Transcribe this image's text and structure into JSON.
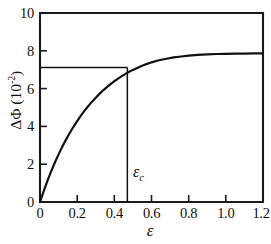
{
  "chart_data": {
    "type": "line",
    "title": "",
    "subtitle": "",
    "xlabel": "ε",
    "ylabel": "ΔΦ (10⁻²)",
    "ylabel_main": "ΔΦ (10",
    "ylabel_exponent": "-2",
    "ylabel_close": ")",
    "xlim": [
      0,
      1.2
    ],
    "ylim": [
      0,
      10
    ],
    "grid": false,
    "legend": "none",
    "x_ticks": [
      0,
      0.2,
      0.4,
      0.6,
      0.8,
      1.0,
      1.2
    ],
    "x_tick_labels": [
      "0",
      "0.2",
      "0.4",
      "0.6",
      "0.8",
      "1.0",
      "1.2"
    ],
    "y_ticks": [
      0,
      2,
      4,
      6,
      8,
      10
    ],
    "y_tick_labels": [
      "0",
      "2",
      "4",
      "6",
      "8",
      "10"
    ],
    "series": [
      {
        "name": "ΔΦ",
        "x": [
          0.0,
          0.02,
          0.04,
          0.06,
          0.08,
          0.1,
          0.12,
          0.14,
          0.16,
          0.18,
          0.2,
          0.22,
          0.24,
          0.26,
          0.28,
          0.3,
          0.32,
          0.34,
          0.36,
          0.38,
          0.4,
          0.42,
          0.44,
          0.46,
          0.47,
          0.48,
          0.5,
          0.52,
          0.54,
          0.56,
          0.58,
          0.6,
          0.64,
          0.68,
          0.72,
          0.76,
          0.8,
          0.85,
          0.9,
          0.95,
          1.0,
          1.05,
          1.1,
          1.15,
          1.2
        ],
        "y": [
          0.0,
          0.58,
          1.12,
          1.62,
          2.09,
          2.52,
          2.93,
          3.3,
          3.65,
          3.98,
          4.28,
          4.57,
          4.83,
          5.08,
          5.31,
          5.52,
          5.72,
          5.91,
          6.08,
          6.24,
          6.39,
          6.53,
          6.66,
          6.78,
          6.84,
          6.89,
          6.99,
          7.08,
          7.17,
          7.25,
          7.32,
          7.39,
          7.5,
          7.58,
          7.65,
          7.7,
          7.74,
          7.78,
          7.81,
          7.83,
          7.84,
          7.85,
          7.85,
          7.86,
          7.86
        ]
      }
    ],
    "annotations": [
      {
        "name": "critical-strain-marker",
        "label": "ε",
        "label_sub": "c",
        "x": 0.47,
        "y_from": 0,
        "y_to": 7.12,
        "type": "vertical-line"
      },
      {
        "name": "critical-value-guide",
        "y": 7.12,
        "x_from": 0,
        "x_to": 0.47,
        "type": "horizontal-line"
      }
    ],
    "plateau_value": 7.86,
    "critical_strain": 0.47,
    "critical_delta_phi": 7.12
  }
}
